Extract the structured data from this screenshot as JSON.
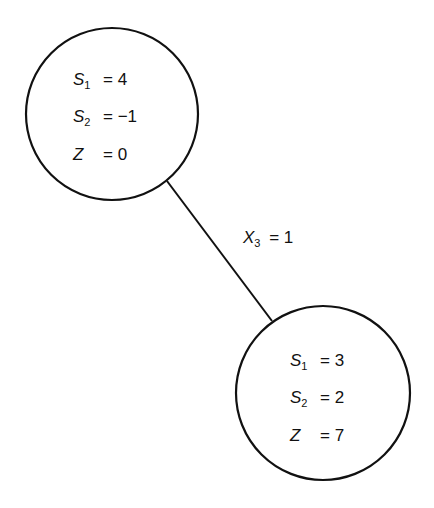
{
  "diagram": {
    "type": "tree",
    "nodes": [
      {
        "id": "node-1",
        "rows": [
          {
            "var": "S",
            "sub": "1",
            "value": "= 4"
          },
          {
            "var": "S",
            "sub": "2",
            "value": "= −1"
          },
          {
            "var": "Z",
            "sub": "",
            "value": "= 0"
          }
        ]
      },
      {
        "id": "node-2",
        "rows": [
          {
            "var": "S",
            "sub": "1",
            "value": "= 3"
          },
          {
            "var": "S",
            "sub": "2",
            "value": "= 2"
          },
          {
            "var": "Z",
            "sub": "",
            "value": "= 7"
          }
        ]
      }
    ],
    "edges": [
      {
        "from": "node-1",
        "to": "node-2",
        "label": {
          "var": "X",
          "sub": "3",
          "value": "= 1"
        }
      }
    ]
  }
}
